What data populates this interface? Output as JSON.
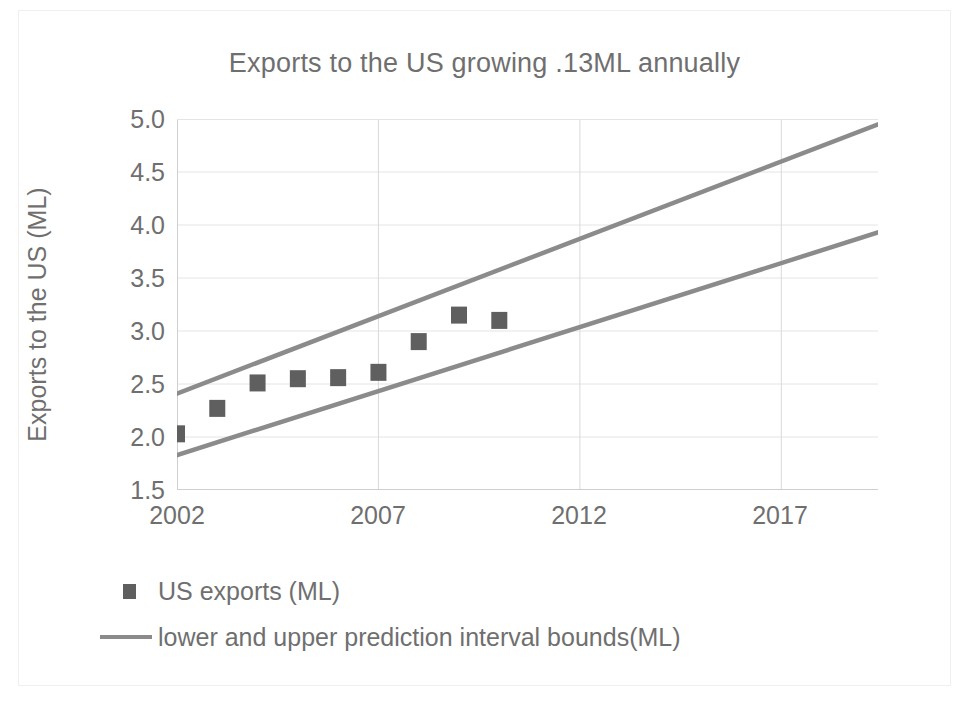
{
  "chart_data": {
    "type": "scatter",
    "title": "Exports to the US growing .13ML annually",
    "xlabel": "",
    "ylabel": "Exports to the US (ML)",
    "xlim": [
      2002,
      2019.4
    ],
    "ylim": [
      1.5,
      5.0
    ],
    "ytick_labels": [
      "5.0",
      "4.5",
      "4.0",
      "3.5",
      "3.0",
      "2.5",
      "2.0",
      "1.5"
    ],
    "ytick_values": [
      5.0,
      4.5,
      4.0,
      3.5,
      3.0,
      2.5,
      2.0,
      1.5
    ],
    "xtick_labels": [
      "2002",
      "2007",
      "2012",
      "2017"
    ],
    "xtick_values": [
      2002,
      2007,
      2012,
      2017
    ],
    "grid": true,
    "legend_position": "bottom-left",
    "marker_color": "#5f5f5f",
    "line_color": "#8b8b8b",
    "text_color": "#6f6f6f",
    "series": [
      {
        "name": "US exports (ML)",
        "type": "scatter",
        "marker": "square",
        "x": [
          2002,
          2003,
          2004,
          2005,
          2006,
          2007,
          2008,
          2009,
          2010
        ],
        "values": [
          2.03,
          2.27,
          2.51,
          2.55,
          2.56,
          2.61,
          2.9,
          3.15,
          3.1
        ]
      },
      {
        "name": "upper prediction interval bound (ML)",
        "type": "line",
        "x": [
          2002,
          2019.4
        ],
        "values": [
          2.41,
          4.95
        ]
      },
      {
        "name": "lower prediction interval bound (ML)",
        "type": "line",
        "x": [
          2002,
          2019.4
        ],
        "values": [
          1.83,
          3.93
        ]
      }
    ],
    "annotations": [
      "Exports to the US growing .13ML annually"
    ]
  },
  "legend": {
    "entries": [
      {
        "label": "US exports (ML)",
        "key": "square-marker"
      },
      {
        "label": "lower and upper prediction interval bounds(ML)",
        "key": "line-marker"
      }
    ]
  }
}
